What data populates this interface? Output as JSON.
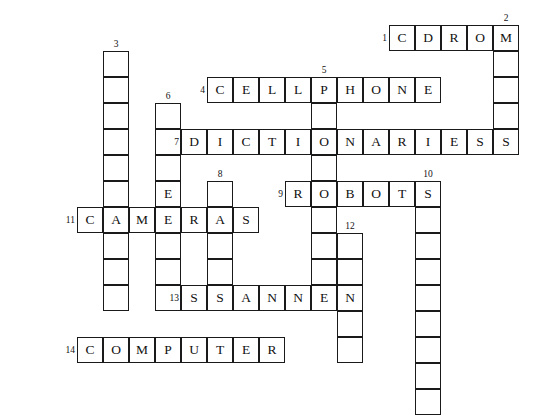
{
  "puzzle": {
    "title": "Technology Crossword Grid",
    "cell_size": 26,
    "origin": {
      "x": 77,
      "y": 25
    },
    "across_entries": [
      {
        "number": "1",
        "answer": "CDROM",
        "row": 0,
        "col": 12
      },
      {
        "number": "4",
        "answer": "CELLPHONE",
        "row": 2,
        "col": 5
      },
      {
        "number": "7",
        "answer": "DICTIONARIES",
        "row": 4,
        "col": 4
      },
      {
        "number": "9",
        "answer": "ROBOTS",
        "row": 6,
        "col": 8
      },
      {
        "number": "11",
        "answer": "CAMERAS",
        "row": 7,
        "col": 0
      },
      {
        "number": "13",
        "answer": "SCANNER",
        "row": 10,
        "col": 4
      },
      {
        "number": "14",
        "answer": "COMPUTER",
        "row": 12,
        "col": 0
      }
    ],
    "down_entries": [
      {
        "number": "2",
        "row": 0,
        "col": 16,
        "length": 5,
        "letters": [
          "M",
          "",
          "",
          "",
          "S"
        ]
      },
      {
        "number": "3",
        "row": 1,
        "col": 1,
        "length": 10,
        "letters": [
          "",
          "",
          "",
          "",
          "",
          "",
          "A",
          "",
          "",
          ""
        ]
      },
      {
        "number": "5",
        "row": 2,
        "col": 9,
        "length": 9,
        "letters": [
          "P",
          "",
          "O",
          "",
          "O",
          "",
          "",
          "",
          "E"
        ]
      },
      {
        "number": "6",
        "row": 3,
        "col": 3,
        "length": 8,
        "letters": [
          "",
          "",
          "",
          "E",
          "",
          "",
          "",
          ""
        ]
      },
      {
        "number": "8",
        "row": 6,
        "col": 5,
        "length": 5,
        "letters": [
          "",
          "A",
          "",
          "",
          "S"
        ]
      },
      {
        "number": "10",
        "row": 6,
        "col": 13,
        "length": 9,
        "letters": [
          "S",
          "",
          "",
          "",
          "",
          "",
          "",
          "",
          ""
        ]
      },
      {
        "number": "12",
        "row": 8,
        "col": 10,
        "length": 5,
        "letters": [
          "",
          "",
          "N",
          "",
          ""
        ]
      }
    ],
    "clue_numbers": [
      "1",
      "2",
      "3",
      "4",
      "5",
      "6",
      "7",
      "8",
      "9",
      "10",
      "11",
      "12",
      "13",
      "14"
    ],
    "colors": {
      "border": "#1a1a1a",
      "cell_background": "#ffffff",
      "text": "#111111",
      "page_background": "#ffffff"
    }
  }
}
